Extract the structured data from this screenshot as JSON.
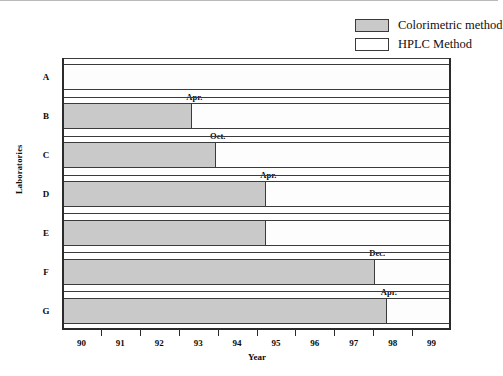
{
  "chart_data": {
    "type": "bar",
    "orientation": "horizontal",
    "title": "",
    "xlabel": "Year",
    "ylabel": "Laboratories",
    "xlim": [
      89.5,
      99.5
    ],
    "xticklabels": [
      "90",
      "91",
      "92",
      "93",
      "94",
      "95",
      "96",
      "97",
      "98",
      "99"
    ],
    "xtickvalues": [
      90,
      91,
      92,
      93,
      94,
      95,
      96,
      97,
      98,
      99
    ],
    "grid": false,
    "legend_position": "top-right",
    "categories": [
      "A",
      "B",
      "C",
      "D",
      "E",
      "F",
      "G"
    ],
    "series": [
      {
        "name": "Colorimetric method",
        "color": "#c9c9c9",
        "values": [
          89.5,
          92.8,
          93.4,
          94.7,
          94.7,
          97.5,
          97.8
        ]
      },
      {
        "name": "HPLC Method",
        "color": "#ffffff",
        "values": [
          99.5,
          99.5,
          99.5,
          99.5,
          99.5,
          99.5,
          99.5
        ]
      }
    ],
    "annotations": [
      {
        "category": "A",
        "text": "",
        "x": null
      },
      {
        "category": "B",
        "text": "Apr.",
        "x": 92.8
      },
      {
        "category": "C",
        "text": "Oct.",
        "x": 93.4
      },
      {
        "category": "D",
        "text": "Apr.",
        "x": 94.7
      },
      {
        "category": "E",
        "text": "",
        "x": 94.7
      },
      {
        "category": "F",
        "text": "Dec.",
        "x": 97.5
      },
      {
        "category": "G",
        "text": "Apr.",
        "x": 97.8
      }
    ]
  },
  "legend": {
    "items": [
      {
        "label": "Colorimetric method",
        "swatch": "filled-gray"
      },
      {
        "label": "HPLC Method",
        "swatch": "empty-white"
      }
    ]
  },
  "axes": {
    "x_title": "Year",
    "y_title": "Laboratories"
  }
}
